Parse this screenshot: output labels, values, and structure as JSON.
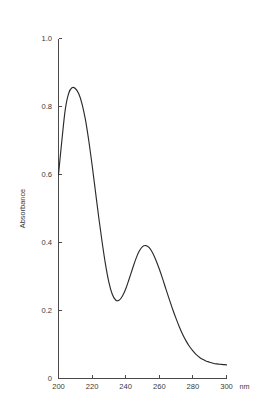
{
  "chart_data": {
    "type": "line",
    "title": "",
    "subtitle": "",
    "xlabel": "nm",
    "ylabel": "Absorbance",
    "xlim": [
      200,
      300
    ],
    "ylim": [
      0,
      1.0
    ],
    "grid": false,
    "legend": null,
    "x_ticks": [
      200,
      220,
      240,
      260,
      280,
      300
    ],
    "x_tick_labels": [
      "200",
      "220",
      "240",
      "260",
      "280",
      "300"
    ],
    "y_ticks": [
      0,
      0.2,
      0.4,
      0.6,
      0.8,
      1.0
    ],
    "y_tick_labels": [
      "0",
      "0.2",
      "0.4",
      "0.6",
      "0.8",
      "1.0"
    ],
    "x_unit_label": "nm",
    "series": [
      {
        "name": "Absorbance spectrum",
        "color": "#2b2b2b",
        "x": [
          200,
          202,
          204,
          206,
          208,
          210,
          212,
          214,
          216,
          218,
          220,
          222,
          224,
          226,
          228,
          230,
          232,
          234,
          236,
          238,
          240,
          242,
          244,
          246,
          248,
          250,
          252,
          254,
          256,
          258,
          260,
          262,
          264,
          266,
          268,
          270,
          272,
          274,
          276,
          278,
          280,
          282,
          284,
          286,
          288,
          290,
          292,
          294,
          296,
          298,
          300
        ],
        "y": [
          0.6,
          0.7,
          0.79,
          0.838,
          0.855,
          0.853,
          0.838,
          0.808,
          0.762,
          0.7,
          0.628,
          0.55,
          0.472,
          0.4,
          0.335,
          0.283,
          0.248,
          0.231,
          0.23,
          0.242,
          0.263,
          0.292,
          0.322,
          0.351,
          0.374,
          0.388,
          0.391,
          0.385,
          0.37,
          0.348,
          0.322,
          0.293,
          0.262,
          0.232,
          0.203,
          0.176,
          0.151,
          0.129,
          0.11,
          0.094,
          0.081,
          0.07,
          0.062,
          0.056,
          0.051,
          0.048,
          0.045,
          0.043,
          0.042,
          0.041,
          0.04
        ]
      }
    ],
    "annotations": {
      "peak_1": {
        "x": 210,
        "y": 0.855
      },
      "valley": {
        "x": 236,
        "y": 0.23
      },
      "peak_2": {
        "x": 252,
        "y": 0.391
      },
      "start": {
        "x": 200,
        "y": 0.6
      },
      "tail": {
        "x": 300,
        "y": 0.04
      }
    }
  }
}
